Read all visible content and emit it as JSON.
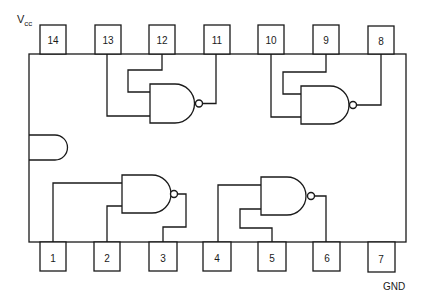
{
  "diagram": {
    "type": "IC pinout - quad 2-input NAND gate, 14-pin DIP",
    "labels": {
      "vcc_main": "V",
      "vcc_sub": "cc",
      "gnd": "GND"
    },
    "top_pins": [
      {
        "number": "14",
        "x": 40
      },
      {
        "number": "13",
        "x": 95
      },
      {
        "number": "12",
        "x": 149
      },
      {
        "number": "11",
        "x": 204
      },
      {
        "number": "10",
        "x": 258
      },
      {
        "number": "9",
        "x": 313
      },
      {
        "number": "8",
        "x": 368
      }
    ],
    "bottom_pins": [
      {
        "number": "1",
        "x": 40
      },
      {
        "number": "2",
        "x": 94
      },
      {
        "number": "3",
        "x": 149
      },
      {
        "number": "4",
        "x": 204
      },
      {
        "number": "5",
        "x": 258
      },
      {
        "number": "6",
        "x": 313
      },
      {
        "number": "7",
        "x": 368
      }
    ],
    "gates": [
      {
        "name": "gate-1",
        "inputs": [
          "1",
          "2"
        ],
        "output": "3"
      },
      {
        "name": "gate-2",
        "inputs": [
          "4",
          "5"
        ],
        "output": "6"
      },
      {
        "name": "gate-3",
        "inputs": [
          "13",
          "12"
        ],
        "output": "11"
      },
      {
        "name": "gate-4",
        "inputs": [
          "10",
          "9"
        ],
        "output": "8"
      }
    ],
    "colors": {
      "line": "#1a1a1a",
      "background": "#ffffff"
    }
  }
}
